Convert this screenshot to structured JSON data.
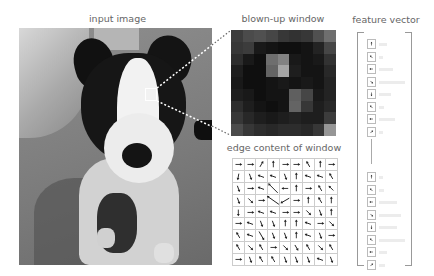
{
  "labels": {
    "input_image": "input image",
    "blown_up_window": "blown-up window",
    "edge_content": "edge content of window",
    "feature_vector": "feature vector"
  },
  "input_image": {
    "description": "grayscale photo of black-and-white dog sitting on carpet",
    "selection_box": {
      "x": 145,
      "y": 88,
      "w": 12,
      "h": 13,
      "color": "#ffffff"
    }
  },
  "blown_up_window": {
    "rows": 9,
    "cols": 9,
    "gray_values": [
      [
        60,
        75,
        80,
        70,
        55,
        50,
        55,
        80,
        110
      ],
      [
        55,
        60,
        25,
        20,
        15,
        15,
        20,
        35,
        70
      ],
      [
        45,
        25,
        15,
        110,
        130,
        25,
        20,
        25,
        50
      ],
      [
        30,
        15,
        15,
        100,
        165,
        30,
        20,
        20,
        40
      ],
      [
        25,
        15,
        15,
        20,
        25,
        20,
        25,
        20,
        35
      ],
      [
        30,
        25,
        15,
        20,
        20,
        95,
        70,
        25,
        35
      ],
      [
        45,
        30,
        20,
        15,
        20,
        100,
        55,
        30,
        40
      ],
      [
        55,
        40,
        30,
        25,
        30,
        35,
        30,
        30,
        60
      ],
      [
        75,
        55,
        45,
        40,
        45,
        45,
        40,
        55,
        150
      ]
    ]
  },
  "edge_content": {
    "rows": 9,
    "cols": 9,
    "angles_deg": [
      [
        0,
        0,
        -60,
        -90,
        0,
        0,
        -120,
        -90,
        0
      ],
      [
        100,
        70,
        200,
        200,
        70,
        -90,
        200,
        200,
        -120
      ],
      [
        70,
        0,
        200,
        -135,
        180,
        -90,
        0,
        -120,
        -135
      ],
      [
        70,
        45,
        0,
        45,
        135,
        0,
        -90,
        -120,
        -90
      ],
      [
        90,
        0,
        200,
        200,
        0,
        0,
        45,
        70,
        -90
      ],
      [
        0,
        200,
        70,
        70,
        -90,
        -90,
        200,
        0,
        45
      ],
      [
        -120,
        200,
        60,
        70,
        70,
        -90,
        200,
        70,
        0
      ],
      [
        -120,
        45,
        -120,
        0,
        45,
        60,
        -120,
        45,
        -120
      ],
      [
        0,
        70,
        -120,
        -120,
        70,
        70,
        70,
        200,
        70
      ]
    ],
    "long_arrows": [
      [
        2,
        3,
        -135,
        2.2
      ],
      [
        3,
        3,
        -145,
        2.4
      ],
      [
        3,
        4,
        150,
        1.6
      ],
      [
        6,
        2,
        60,
        1.6
      ]
    ]
  },
  "feature_vector": {
    "top_items": [
      {
        "angle": -90,
        "bar": 8
      },
      {
        "angle": -135,
        "bar": 4
      },
      {
        "angle": 180,
        "bar": 14
      },
      {
        "angle": 45,
        "bar": 26
      },
      {
        "angle": 90,
        "bar": 12
      },
      {
        "angle": -135,
        "bar": 5
      },
      {
        "angle": 180,
        "bar": 16
      },
      {
        "angle": -45,
        "bar": 4
      }
    ],
    "bottom_items": [
      {
        "angle": -90,
        "bar": 4
      },
      {
        "angle": -135,
        "bar": 5
      },
      {
        "angle": 180,
        "bar": 18
      },
      {
        "angle": 45,
        "bar": 22
      },
      {
        "angle": 90,
        "bar": 18
      },
      {
        "angle": -135,
        "bar": 26
      },
      {
        "angle": 180,
        "bar": 8
      },
      {
        "angle": -45,
        "bar": 6
      }
    ]
  }
}
